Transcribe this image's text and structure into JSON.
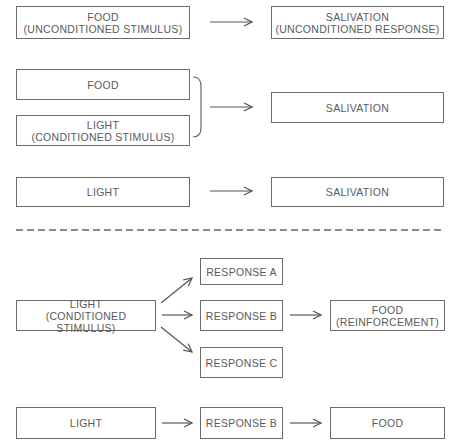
{
  "classical_conditioning": {
    "row1": {
      "left": {
        "line1": "FOOD",
        "line2": "(UNCONDITIONED STIMULUS)"
      },
      "right": {
        "line1": "SALIVATION",
        "line2": "(UNCONDITIONED RESPONSE)"
      }
    },
    "row2": {
      "left_top": {
        "line1": "FOOD"
      },
      "left_bottom": {
        "line1": "LIGHT",
        "line2": "(CONDITIONED STIMULUS)"
      },
      "right": {
        "line1": "SALIVATION"
      }
    },
    "row3": {
      "left": {
        "line1": "LIGHT"
      },
      "right": {
        "line1": "SALIVATION"
      }
    }
  },
  "operant_conditioning": {
    "stimulus": {
      "line1": "LIGHT",
      "line2": "(CONDITIONED STIMULUS)"
    },
    "responses": [
      {
        "line1": "RESPONSE A"
      },
      {
        "line1": "RESPONSE B"
      },
      {
        "line1": "RESPONSE C"
      }
    ],
    "reinforcement": {
      "line1": "FOOD",
      "line2": "(REINFORCEMENT)"
    },
    "summary": {
      "stimulus": "LIGHT",
      "response": "RESPONSE B",
      "outcome": "FOOD"
    }
  },
  "colors": {
    "line": "#6a6a6a",
    "text": "#5a5a5a",
    "background": "#ffffff"
  }
}
